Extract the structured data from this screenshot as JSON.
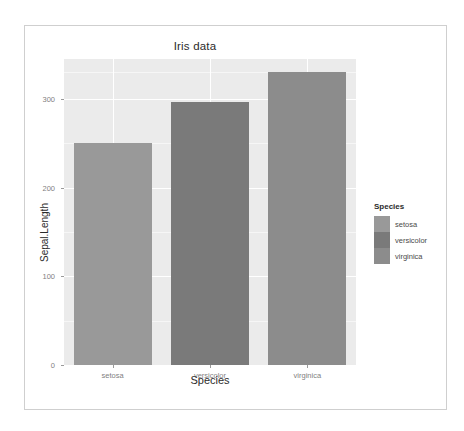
{
  "chart_data": {
    "type": "bar",
    "title": "Iris data",
    "xlabel": "Species",
    "ylabel": "Sepal.Length",
    "categories": [
      "setosa",
      "versicolor",
      "virginica"
    ],
    "values": [
      250,
      297,
      330
    ],
    "ylim": [
      0,
      345
    ],
    "yticks": [
      0,
      100,
      200,
      300
    ],
    "ytick_labels": [
      "0",
      "100",
      "200",
      "300"
    ],
    "grid": true,
    "legend": {
      "title": "Species",
      "position": "right",
      "entries": [
        {
          "label": "setosa",
          "color": "#999999"
        },
        {
          "label": "versicolor",
          "color": "#7a7a7a"
        },
        {
          "label": "virginica",
          "color": "#8c8c8c"
        }
      ]
    },
    "series": [
      {
        "name": "Sepal.Length",
        "points": [
          {
            "category": "setosa",
            "value": 250,
            "color": "#999999"
          },
          {
            "category": "versicolor",
            "value": 297,
            "color": "#7a7a7a"
          },
          {
            "category": "virginica",
            "value": 330,
            "color": "#8c8c8c"
          }
        ]
      }
    ],
    "panel_background": "#ebebeb",
    "gridline_color": "#ffffff"
  }
}
